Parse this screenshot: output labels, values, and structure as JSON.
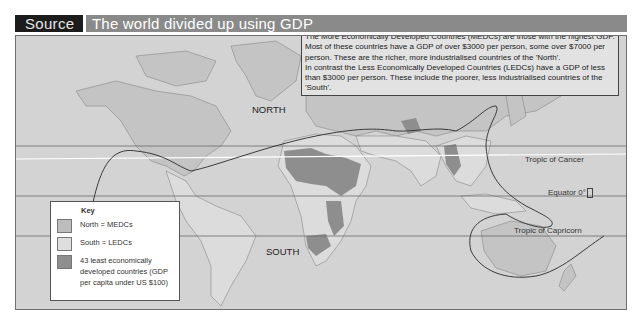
{
  "header": {
    "source_label": "Source 1",
    "title": "The world divided up using GDP"
  },
  "info_box": {
    "paragraph_1": "The More Economically Developed Countries (MEDCs) are those with the highest GDP. Most of these countries have a GDP of over $3000 per person, some over $7000 per person. These are the richer, more industrialised countries of the 'North'.",
    "paragraph_2": "In contrast the Less Economically Developed Countries (LEDCs) have a GDP of less than $3000 per person. These include the poorer, less industrialised countries of the 'South'."
  },
  "map": {
    "region_labels": {
      "north": "NORTH",
      "south": "SOUTH"
    },
    "lines": {
      "tropic_cancer": "Tropic of Cancer",
      "equator": "Equator 0°",
      "tropic_capricorn": "Tropic of Capricorn"
    },
    "colors": {
      "ocean": "#d3d3d3",
      "north_medc": "#c4c4c4",
      "south_ledc": "#dcdcdc",
      "least_developed": "#8e8e8e",
      "divide_line": "#3a3a3a"
    }
  },
  "key": {
    "title": "Key",
    "items": [
      {
        "label": "North = MEDCs",
        "color": "#bdbdbd"
      },
      {
        "label": "South = LEDCs",
        "color": "#dedede"
      },
      {
        "label": "43 least economically developed countries (GDP per capita under US $100)",
        "color": "#8e8e8e"
      }
    ]
  }
}
